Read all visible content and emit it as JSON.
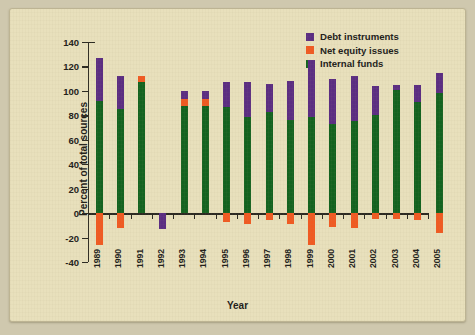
{
  "chart_data": {
    "type": "bar",
    "stacked": true,
    "title": "",
    "xlabel": "Year",
    "ylabel": "Percent of total sources",
    "ylim": [
      -40,
      140
    ],
    "ytick_step": 20,
    "yticks": [
      140,
      120,
      100,
      80,
      60,
      40,
      20,
      0,
      -20,
      -40
    ],
    "ytick_labels": [
      "140",
      "120",
      "100",
      "80",
      "60",
      "40",
      "20",
      "0",
      "-20",
      "-40"
    ],
    "xticks": [
      "1989",
      "1990",
      "1991",
      "1992",
      "1993",
      "1994",
      "1995",
      "1996",
      "1997",
      "1998",
      "1999",
      "2000",
      "2001",
      "2002",
      "2003",
      "2004",
      "2005"
    ],
    "grid": false,
    "legend_position": "top-right",
    "colors": {
      "debt": "#5b2d82",
      "equity": "#f05a22",
      "internal": "#13631f",
      "background": "#e8e0bc",
      "page": "#cfc8ae",
      "axis": "#2c2a22"
    },
    "series": [
      {
        "name": "Debt instruments",
        "key": "debt",
        "color": "#5b2d82"
      },
      {
        "name": "Net equity issues",
        "key": "equity",
        "color": "#f05a22"
      },
      {
        "name": "Internal funds",
        "key": "internal",
        "color": "#13631f"
      }
    ],
    "categories": [
      "1989",
      "1990",
      "1991",
      "1992",
      "1993",
      "1994",
      "1995",
      "1996",
      "1997",
      "1998",
      "1999",
      "2000",
      "2001",
      "2002",
      "2003",
      "2004"
    ],
    "bars": [
      {
        "year": "1989",
        "internal": 92,
        "equity": -26,
        "debt": 35,
        "total_positive": 127
      },
      {
        "year": "1990",
        "internal": 85,
        "equity": -12,
        "debt": 27,
        "total_positive": 112
      },
      {
        "year": "1991",
        "internal": 107,
        "equity": 5,
        "debt": 0,
        "total_positive": 112
      },
      {
        "year": "1992",
        "internal": 0,
        "equity": 0,
        "debt": -13,
        "total_positive": 0
      },
      {
        "year": "1993",
        "internal": 88,
        "equity": 5,
        "debt": 7,
        "total_positive": 100
      },
      {
        "year": "1994",
        "internal": 88,
        "equity": 5,
        "debt": 7,
        "total_positive": 100
      },
      {
        "year": "1995",
        "internal": 87,
        "equity": -7,
        "debt": 20,
        "total_positive": 107
      },
      {
        "year": "1996",
        "internal": 79,
        "equity": -9,
        "debt": 28,
        "total_positive": 107
      },
      {
        "year": "1997",
        "internal": 83,
        "equity": -6,
        "debt": 23,
        "total_positive": 106
      },
      {
        "year": "1998",
        "internal": 76,
        "equity": -9,
        "debt": 32,
        "total_positive": 108
      },
      {
        "year": "1999",
        "internal": 79,
        "equity": -26,
        "debt": 46,
        "total_positive": 125
      },
      {
        "year": "2000",
        "internal": 73,
        "equity": -11,
        "debt": 37,
        "total_positive": 110
      },
      {
        "year": "2001",
        "internal": 75,
        "equity": -12,
        "debt": 37,
        "total_positive": 112
      },
      {
        "year": "2002",
        "internal": 80,
        "equity": -5,
        "debt": 24,
        "total_positive": 104
      },
      {
        "year": "2003",
        "internal": 101,
        "equity": -5,
        "debt": 4,
        "total_positive": 105
      },
      {
        "year": "2004",
        "internal": 91,
        "equity": -6,
        "debt": 14,
        "total_positive": 105
      },
      {
        "year": "2005",
        "internal": 98,
        "equity": -16,
        "debt": 17,
        "total_positive": 115
      }
    ]
  }
}
